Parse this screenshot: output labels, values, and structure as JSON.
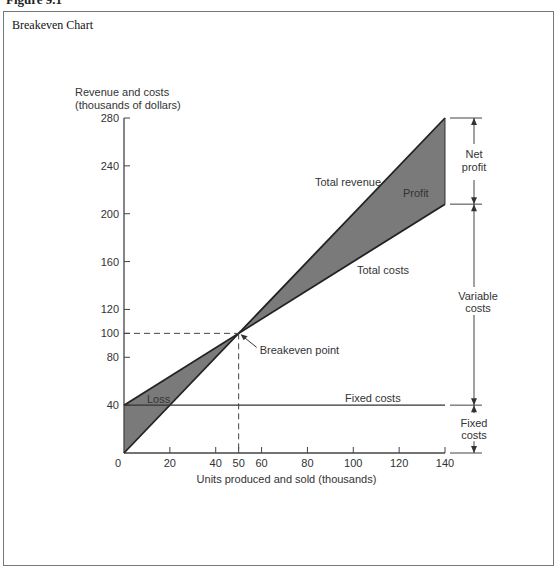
{
  "figure": {
    "label": "Figure 9.1",
    "title": "Breakeven Chart"
  },
  "chart_data": {
    "type": "line",
    "title": "Breakeven Chart",
    "xlabel": "Units produced and sold (thousands)",
    "ylabel_line1": "Revenue and costs",
    "ylabel_line2": "(thousands of dollars)",
    "xlim": [
      0,
      140
    ],
    "ylim": [
      0,
      280
    ],
    "x_ticks": [
      0,
      20,
      40,
      50,
      60,
      80,
      100,
      120,
      140
    ],
    "y_ticks": [
      40,
      80,
      100,
      120,
      160,
      200,
      240,
      280
    ],
    "grid": false,
    "series": [
      {
        "name": "Total revenue",
        "x": [
          0,
          140
        ],
        "y": [
          0,
          280
        ]
      },
      {
        "name": "Total costs",
        "x": [
          0,
          140
        ],
        "y": [
          40,
          208
        ]
      },
      {
        "name": "Fixed costs",
        "x": [
          0,
          140
        ],
        "y": [
          40,
          40
        ]
      }
    ],
    "breakeven": {
      "x": 50,
      "y": 100,
      "label": "Breakeven point"
    },
    "regions": [
      {
        "name": "Loss",
        "fill": "#7a7a7a"
      },
      {
        "name": "Profit",
        "fill": "#7a7a7a"
      }
    ],
    "annotations": {
      "net_profit": [
        "Net",
        "profit"
      ],
      "variable_costs": [
        "Variable",
        "costs"
      ],
      "fixed_costs": [
        "Fixed",
        "costs"
      ],
      "total_revenue": "Total revenue",
      "total_costs": "Total costs",
      "fixed_costs_line": "Fixed costs",
      "profit": "Profit",
      "loss": "Loss"
    }
  }
}
